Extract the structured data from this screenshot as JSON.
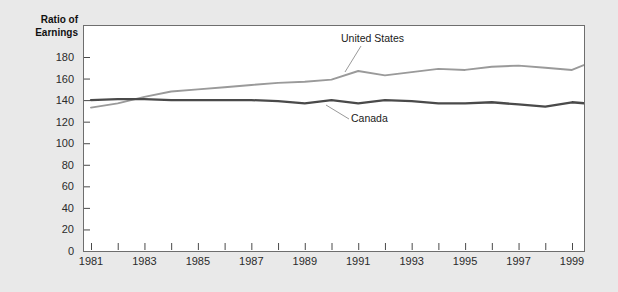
{
  "chart_data": {
    "type": "line",
    "title": "",
    "ylabel": "Ratio of\nEarnings",
    "xlabel": "",
    "ylim": [
      0,
      180
    ],
    "yticks": [
      0,
      20,
      40,
      60,
      80,
      100,
      120,
      140,
      160,
      180
    ],
    "xlim": [
      1981,
      2000
    ],
    "xticks": [
      1981,
      1982,
      1983,
      1984,
      1985,
      1986,
      1987,
      1988,
      1989,
      1990,
      1991,
      1992,
      1993,
      1994,
      1995,
      1996,
      1997,
      1998,
      1999,
      2000
    ],
    "xticklabels": [
      "1981",
      "",
      "1983",
      "",
      "1985",
      "",
      "1987",
      "",
      "1989",
      "",
      "1991",
      "",
      "1993",
      "",
      "1995",
      "",
      "1997",
      "",
      "1999",
      ""
    ],
    "grid": false,
    "legend": "inline-annotations",
    "x": [
      1981,
      1982,
      1983,
      1984,
      1985,
      1986,
      1987,
      1988,
      1989,
      1990,
      1991,
      1992,
      1993,
      1994,
      1995,
      1996,
      1997,
      1998,
      1999,
      2000
    ],
    "series": [
      {
        "name": "United States",
        "color": "#9a9a9a",
        "values": [
          133,
          137,
          143,
          148,
          150,
          152,
          154,
          156,
          157,
          159,
          167,
          163,
          166,
          169,
          168,
          171,
          172,
          170,
          168,
          178
        ]
      },
      {
        "name": "Canada",
        "color": "#4a4a4a",
        "values": [
          140,
          141,
          141,
          140,
          140,
          140,
          140,
          139,
          137,
          140,
          137,
          140,
          139,
          137,
          137,
          138,
          136,
          134,
          138,
          136
        ]
      }
    ],
    "annotations": [
      {
        "text": "United States",
        "series": "United States"
      },
      {
        "text": "Canada",
        "series": "Canada"
      }
    ]
  },
  "colors": {
    "page_background": "#e9e9e9",
    "plot_background": "#ffffff",
    "axis": "#6e6e6e",
    "text": "#2b2b2b",
    "united_states_line": "#9a9a9a",
    "canada_line": "#4a4a4a"
  }
}
